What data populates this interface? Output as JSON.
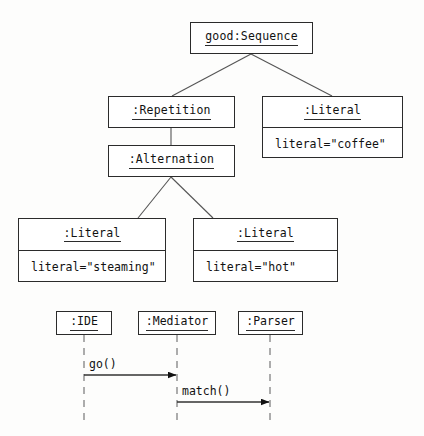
{
  "diagram": {
    "object_diagram": {
      "nodes": [
        {
          "id": "root",
          "name": "good:Sequence",
          "attribute": null,
          "x": 190,
          "y": 22,
          "w": 123,
          "h": 32
        },
        {
          "id": "repetition",
          "name": ":Repetition",
          "attribute": null,
          "x": 108,
          "y": 96,
          "w": 127,
          "h": 32
        },
        {
          "id": "literal-coffee",
          "name": ":Literal",
          "attribute": "literal=\"coffee\"",
          "x": 262,
          "y": 96,
          "w": 141,
          "h": 62
        },
        {
          "id": "alternation",
          "name": ":Alternation",
          "attribute": null,
          "x": 108,
          "y": 145,
          "w": 127,
          "h": 32
        },
        {
          "id": "literal-steaming",
          "name": ":Literal",
          "attribute": "literal=\"steaming\"",
          "x": 18,
          "y": 218,
          "w": 148,
          "h": 64
        },
        {
          "id": "literal-hot",
          "name": ":Literal",
          "attribute": "literal=\"hot\"",
          "x": 193,
          "y": 218,
          "w": 145,
          "h": 64
        }
      ],
      "edges": [
        {
          "from": "root",
          "to": "repetition",
          "style": "fork"
        },
        {
          "from": "root",
          "to": "literal-coffee",
          "style": "fork"
        },
        {
          "from": "repetition",
          "to": "alternation",
          "style": "straight"
        },
        {
          "from": "alternation",
          "to": "literal-steaming",
          "style": "fork"
        },
        {
          "from": "alternation",
          "to": "literal-hot",
          "style": "fork"
        }
      ]
    },
    "sequence_diagram": {
      "lifelines": [
        {
          "id": "ide",
          "name": ":IDE",
          "x": 56,
          "y": 311,
          "w": 56,
          "h": 24
        },
        {
          "id": "mediator",
          "name": ":Mediator",
          "x": 138,
          "y": 311,
          "w": 78,
          "h": 24
        },
        {
          "id": "parser",
          "name": ":Parser",
          "x": 238,
          "y": 311,
          "w": 65,
          "h": 24
        }
      ],
      "lifeline_bottom": 424,
      "messages": [
        {
          "label": "go()",
          "from": "ide",
          "to": "mediator",
          "y": 375,
          "label_x": 84,
          "label_y": 357
        },
        {
          "label": "match()",
          "from": "mediator",
          "to": "parser",
          "y": 402,
          "label_x": 178,
          "label_y": 384
        }
      ]
    },
    "colors": {
      "stroke": "#2b2b2b",
      "edge": "#555555",
      "lifeline": "#777777",
      "background": "#fdfdfc",
      "text": "#111111"
    }
  }
}
